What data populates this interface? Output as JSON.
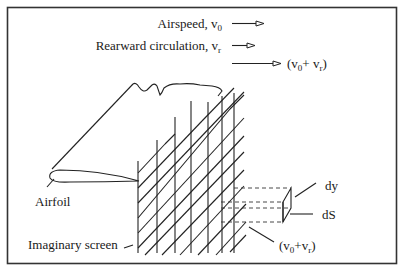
{
  "figure": {
    "legend": {
      "airspeed": {
        "label": "Airspeed, v",
        "subscript": "0"
      },
      "rearward": {
        "label": "Rearward circulation, v",
        "subscript": "r"
      },
      "sum": {
        "open": "(v",
        "sub1": "0",
        "plus": "+ v",
        "sub2": "r",
        "close": ")"
      }
    },
    "labels": {
      "airfoil": "Airfoil",
      "screen": "Imaginary screen",
      "dy": "dy",
      "ds": "dS",
      "element_velocity": {
        "open": "(v",
        "sub1": "0",
        "plus": "+v",
        "sub2": "r",
        "close": ")"
      }
    },
    "icons": [
      "arrow-right-icon"
    ],
    "colors": {
      "line": "#222222",
      "background": "#ffffff"
    }
  }
}
